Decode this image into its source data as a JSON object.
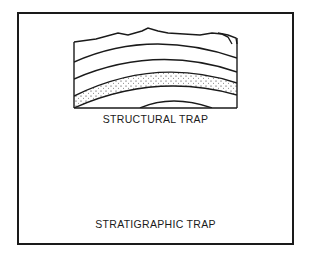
{
  "figure": {
    "panels": [
      {
        "id": "structural",
        "caption": "STRUCTURAL TRAP",
        "description": "Anticline: curved rock layers arched upward with a dotted porous reservoir bed"
      },
      {
        "id": "stratigraphic",
        "caption": "STRATIGRAPHIC TRAP",
        "description": "Tilted dipping beds truncated by an unconformity, with a dotted reservoir bed pinching out beneath horizontal cap layers"
      }
    ],
    "colors": {
      "line": "#1a1a1a",
      "background": "#ffffff"
    }
  }
}
